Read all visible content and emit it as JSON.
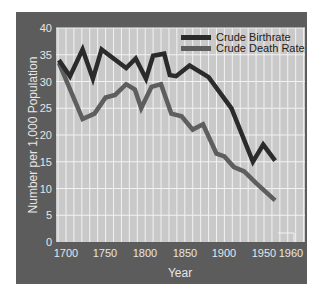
{
  "chart_data": {
    "type": "line",
    "title": "",
    "xlabel": "Year",
    "ylabel": "Number per 1,000 Population",
    "ylim": [
      0,
      40
    ],
    "xlim": [
      1688,
      1980
    ],
    "grid": true,
    "legend_position": "top-right",
    "x_ticks": [
      1700,
      1750,
      1800,
      1850,
      1900,
      1950,
      1960
    ],
    "x_tick_labels": [
      "1700",
      "1750",
      "1800",
      "1850",
      "1900",
      "1950",
      "1960"
    ],
    "y_ticks": [
      0,
      5,
      10,
      15,
      20,
      25,
      30,
      35,
      40
    ],
    "y_tick_labels": [
      "0",
      "5",
      "10",
      "15",
      "20",
      "25",
      "30",
      "35",
      "40"
    ],
    "series": [
      {
        "name": "Crude Birthrate",
        "color": "#2b2b2b",
        "points": [
          [
            1691,
            34
          ],
          [
            1705,
            31
          ],
          [
            1721,
            36
          ],
          [
            1734,
            30.5
          ],
          [
            1745,
            36
          ],
          [
            1776,
            32.5
          ],
          [
            1788,
            34.3
          ],
          [
            1801,
            30.5
          ],
          [
            1810,
            34.8
          ],
          [
            1824,
            35.2
          ],
          [
            1831,
            31.2
          ],
          [
            1839,
            31
          ],
          [
            1856,
            33
          ],
          [
            1880,
            30.8
          ],
          [
            1909,
            25
          ],
          [
            1936,
            15
          ],
          [
            1949,
            18.2
          ],
          [
            1964,
            15.2
          ]
        ]
      },
      {
        "name": "Crude Death Rate",
        "color": "#5e5e5e",
        "points": [
          [
            1691,
            33.5
          ],
          [
            1721,
            23
          ],
          [
            1736,
            24
          ],
          [
            1750,
            27
          ],
          [
            1762,
            27.5
          ],
          [
            1776,
            29.5
          ],
          [
            1787,
            28.5
          ],
          [
            1795,
            25
          ],
          [
            1808,
            29
          ],
          [
            1820,
            29.5
          ],
          [
            1833,
            24
          ],
          [
            1846,
            23.5
          ],
          [
            1860,
            21
          ],
          [
            1873,
            22
          ],
          [
            1890,
            16.5
          ],
          [
            1900,
            16
          ],
          [
            1912,
            14
          ],
          [
            1925,
            13.2
          ],
          [
            1940,
            11
          ],
          [
            1964,
            7.8
          ]
        ]
      }
    ]
  },
  "colors": {
    "frame": "#5c5c5c",
    "plot_bg": "#c9c9c9",
    "grid": "#f2f2f2",
    "birth_line": "#2b2b2b",
    "death_line": "#5e5e5e",
    "tick_text": "#e6e6e6",
    "legend_text": "#222222"
  }
}
